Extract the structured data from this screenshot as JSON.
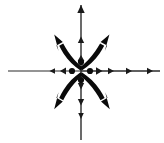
{
  "figure": {
    "title": "Star node vector field diagram",
    "background_color": "#ffffff",
    "stroke_color": "#1a1a1a",
    "width": 164,
    "height": 143,
    "origin": {
      "x": 81,
      "y": 71
    }
  },
  "chart_data": {
    "type": "scatter",
    "title": "",
    "subtitle": "",
    "xlabel": "",
    "ylabel": "",
    "grid": false,
    "legend": null,
    "axes_visible": true,
    "xlim": [
      -81,
      83
    ],
    "ylim": [
      -72,
      71
    ],
    "series": [
      {
        "name": "axis-right",
        "kind": "straight-axis",
        "direction_degrees": 0,
        "x": [
          81,
          160
        ],
        "y": [
          71,
          71
        ],
        "arrow_marker_positions": [
          100,
          112,
          131,
          152
        ],
        "stroke_width": 1.6
      },
      {
        "name": "axis-left",
        "kind": "straight-axis",
        "direction_degrees": 180,
        "x": [
          81,
          8
        ],
        "y": [
          71,
          71
        ],
        "arrow_marker_positions": [
          62,
          51
        ],
        "stroke_width": 1.2
      },
      {
        "name": "axis-up",
        "kind": "straight-axis",
        "direction_degrees": 90,
        "x": [
          81,
          81
        ],
        "y": [
          71,
          5
        ],
        "arrow_marker_positions": [
          57,
          38,
          8
        ],
        "stroke_width": 1.4
      },
      {
        "name": "axis-down",
        "kind": "straight-axis",
        "direction_degrees": 270,
        "x": [
          81,
          81
        ],
        "y": [
          71,
          140
        ],
        "arrow_marker_positions": [
          88,
          104,
          118
        ],
        "stroke_width": 1.4
      },
      {
        "name": "separatrix-upper-left",
        "kind": "thick-curved-arrow",
        "direction_degrees": 135,
        "start": [
          77,
          68
        ],
        "end": [
          55,
          35
        ]
      },
      {
        "name": "separatrix-upper-right",
        "kind": "thick-curved-arrow",
        "direction_degrees": 45,
        "start": [
          85,
          68
        ],
        "end": [
          108,
          35
        ]
      },
      {
        "name": "separatrix-lower-left",
        "kind": "thick-curved-arrow",
        "direction_degrees": 225,
        "start": [
          77,
          75
        ],
        "end": [
          55,
          110
        ]
      },
      {
        "name": "separatrix-lower-right",
        "kind": "thick-curved-arrow",
        "direction_degrees": 315,
        "start": [
          85,
          75
        ],
        "end": [
          110,
          110
        ]
      }
    ],
    "points": [
      {
        "name": "dot-left",
        "x": 72,
        "y": 71,
        "radius": 3.1
      },
      {
        "name": "dot-right",
        "x": 90,
        "y": 71,
        "radius": 3.1
      },
      {
        "name": "dot-up",
        "x": 81,
        "y": 62,
        "radius": 3.1
      },
      {
        "name": "dot-down",
        "x": 81,
        "y": 80,
        "radius": 3.1
      }
    ],
    "annotations": []
  }
}
